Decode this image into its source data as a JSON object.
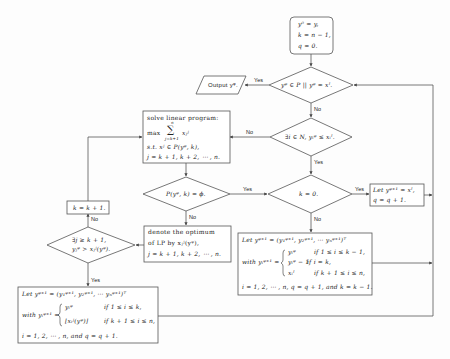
{
  "colors": {
    "stroke": "#555555",
    "text": "#222222",
    "background": "#fdfdfd"
  },
  "start": {
    "line1": "y⁰ = y,",
    "line2": "k = n − 1,",
    "line3": "q = 0."
  },
  "decision_main": {
    "text": "yᵠ ∈ P || yᵠ = xᴵ."
  },
  "output": {
    "text": "Output yᵠ."
  },
  "decision_exists": {
    "text": "∃i ∈ N, yᵢᵠ ≤ xᵢᴵ."
  },
  "lp_box": {
    "line1": "solve linear program:",
    "line2_max": "max",
    "line2_sum": "∑",
    "line2_sum_top": "n",
    "line2_sum_bottom": "j=k+1",
    "line2_var": "xⱼʲ",
    "line3": "s.t. xʲ ∈ P(yᵠ, k),",
    "line4": "j = k + 1, k + 2, ⋯ , n."
  },
  "decision_empty": {
    "text": "P(yᵠ, k) = ϕ."
  },
  "decision_k0": {
    "text": "k = 0."
  },
  "let_box_right": {
    "line1": "Let yᵠ⁺¹ = xᴵ,",
    "line2": "q = q + 1."
  },
  "denote_box": {
    "line1": "denote the optimum",
    "line2": "of LP by xⱼʲ(yᵠ),",
    "line3": "j = k + 1, k + 2, ⋯ , n."
  },
  "k_increment_box": {
    "text": "k = k + 1."
  },
  "decision_j": {
    "line1": "∃j ≥ k + 1,",
    "line2": "yⱼᵠ > xⱼʲ(yᵠ)."
  },
  "update_box_middle": {
    "line1": "Let yᵠ⁺¹ = (y₁ᵠ⁺¹, y₂ᵠ⁺¹, ⋯ yₙᵠ⁺¹)ᵀ",
    "with": "with yᵢᵠ⁺¹ =",
    "case1_val": "yᵢᵠ",
    "case1_cond": "if 1 ≤ i ≤ k − 1,",
    "case2_val": "yᵢᵠ − 1",
    "case2_cond": "if i = k,",
    "case3_val": "xᵢᴵ",
    "case3_cond": "if k + 1 ≤ i ≤ n,",
    "line_last": "i = 1, 2, ⋯ , n, q = q + 1, and k = k − 1."
  },
  "update_box_bottom": {
    "line1": "Let yᵠ⁺¹ = (y₁ᵠ⁺¹, y₂ᵠ⁺¹, ⋯ yₙᵠ⁺¹)ᵀ",
    "with": "with yᵢᵠ⁺¹ =",
    "case1_val": "yᵢᵠ",
    "case1_cond": "if 1 ≤ i ≤ k,",
    "case2_val": "⌊xᵢʲ(yᵠ)⌋",
    "case2_cond": "if k + 1 ≤ i ≤ n,",
    "line_last": "i = 1, 2, ⋯ , n, and q = q + 1."
  },
  "edge_labels": {
    "main_yes": "Yes",
    "main_no": "No",
    "exists_no": "No",
    "exists_yes": "Yes",
    "empty_yes": "Yes",
    "empty_no": "No",
    "k0_yes": "Yes",
    "k0_no": "No",
    "j_no": "No",
    "j_yes": "Yes"
  }
}
